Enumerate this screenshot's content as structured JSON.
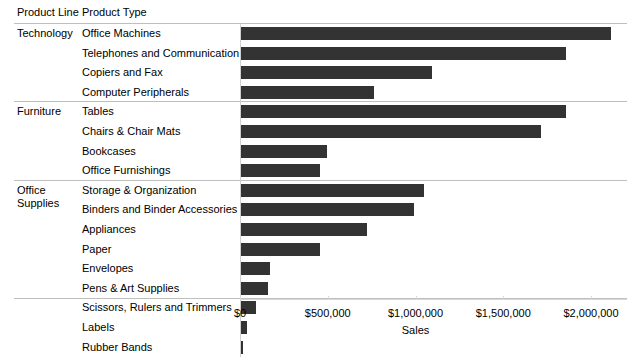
{
  "header": {
    "product_line_label": "Product Line",
    "product_type_label": "Product Type"
  },
  "axis": {
    "title": "Sales",
    "tick_labels": [
      "$0",
      "$500,000",
      "$1,000,000",
      "$1,500,000",
      "$2,000,000"
    ],
    "tick_values": [
      0,
      500000,
      1000000,
      1500000,
      2000000
    ]
  },
  "colors": {
    "bar": "#333333",
    "gridline": "#bfbfbf",
    "axis": "#d8d8d8",
    "text": "#000000"
  },
  "groups": [
    {
      "name": "Technology",
      "rows": [
        {
          "label": "Office Machines",
          "value": 2110000
        },
        {
          "label": "Telephones and Communication",
          "value": 1850000
        },
        {
          "label": "Copiers and Fax",
          "value": 1090000
        },
        {
          "label": "Computer Peripherals",
          "value": 760000
        }
      ]
    },
    {
      "name": "Furniture",
      "rows": [
        {
          "label": "Tables",
          "value": 1850000
        },
        {
          "label": "Chairs & Chair Mats",
          "value": 1710000
        },
        {
          "label": "Bookcases",
          "value": 490000
        },
        {
          "label": "Office Furnishings",
          "value": 450000
        }
      ]
    },
    {
      "name": "Office Supplies",
      "rows": [
        {
          "label": "Storage & Organization",
          "value": 1040000
        },
        {
          "label": "Binders and Binder Accessories",
          "value": 985000
        },
        {
          "label": "Appliances",
          "value": 720000
        },
        {
          "label": "Paper",
          "value": 450000
        },
        {
          "label": "Envelopes",
          "value": 165000
        },
        {
          "label": "Pens & Art Supplies",
          "value": 155000
        },
        {
          "label": "Scissors, Rulers and Trimmers",
          "value": 85000
        },
        {
          "label": "Labels",
          "value": 35000
        },
        {
          "label": "Rubber Bands",
          "value": 8000
        }
      ]
    }
  ],
  "chart_data": {
    "type": "bar",
    "orientation": "horizontal",
    "title": "",
    "xlabel": "Sales",
    "ylabel": "",
    "xlim": [
      0,
      2205000
    ],
    "grid": false,
    "legend": null,
    "group_by": [
      "Product Line",
      "Product Type"
    ],
    "categories": [
      "Office Machines",
      "Telephones and Communication",
      "Copiers and Fax",
      "Computer Peripherals",
      "Tables",
      "Chairs & Chair Mats",
      "Bookcases",
      "Office Furnishings",
      "Storage & Organization",
      "Binders and Binder Accessories",
      "Appliances",
      "Paper",
      "Envelopes",
      "Pens & Art Supplies",
      "Scissors, Rulers and Trimmers",
      "Labels",
      "Rubber Bands"
    ],
    "category_groups": [
      "Technology",
      "Technology",
      "Technology",
      "Technology",
      "Furniture",
      "Furniture",
      "Furniture",
      "Furniture",
      "Office Supplies",
      "Office Supplies",
      "Office Supplies",
      "Office Supplies",
      "Office Supplies",
      "Office Supplies",
      "Office Supplies",
      "Office Supplies",
      "Office Supplies"
    ],
    "values": [
      2110000,
      1850000,
      1090000,
      760000,
      1850000,
      1710000,
      490000,
      450000,
      1040000,
      985000,
      720000,
      450000,
      165000,
      155000,
      85000,
      35000,
      8000
    ],
    "xticks": [
      0,
      500000,
      1000000,
      1500000,
      2000000
    ],
    "xticklabels": [
      "$0",
      "$500,000",
      "$1,000,000",
      "$1,500,000",
      "$2,000,000"
    ]
  }
}
